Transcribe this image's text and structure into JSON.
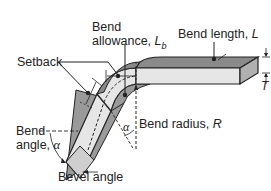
{
  "labels": {
    "bend_allowance_line1": "Bend",
    "bend_allowance_line2": "allowance, ",
    "bend_allowance_symbol": "L",
    "bend_allowance_sub": "b",
    "bend_length": "Bend length, ",
    "bend_length_symbol": "L",
    "setback": "Setback",
    "thickness_symbol": "T",
    "bend_angle_line1": "Bend",
    "bend_angle_line2": "angle, ",
    "bend_angle_symbol": "α",
    "alpha_inner": "α",
    "bend_radius": "Bend radius, ",
    "bend_radius_symbol": "R",
    "bevel_angle": "Bevel angle"
  },
  "colors": {
    "top_face": "#8a8a8a",
    "side_face": "#e6e6e6",
    "end_face": "#b0b0b0",
    "dark_face": "#9a9a9a",
    "line": "#222222"
  }
}
